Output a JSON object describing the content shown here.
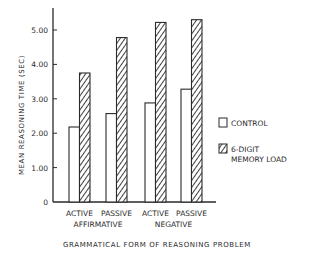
{
  "chart_data": {
    "type": "bar",
    "title": "",
    "xlabel": "GRAMMATICAL FORM OF REASONING PROBLEM",
    "ylabel": "MEAN REASONING TIME (SEC)",
    "ylim": [
      0,
      5.6
    ],
    "yticks": [
      0,
      1,
      2,
      3,
      4,
      5
    ],
    "ytick_labels": [
      "0",
      "1.00",
      "2.00",
      "3.00",
      "4.00",
      "5.00"
    ],
    "categories": [
      "ACTIVE",
      "PASSIVE",
      "ACTIVE",
      "PASSIVE"
    ],
    "category_groups": [
      {
        "label": "AFFIRMATIVE",
        "span": [
          0,
          1
        ]
      },
      {
        "label": "NEGATIVE",
        "span": [
          2,
          3
        ]
      }
    ],
    "series": [
      {
        "name": "CONTROL",
        "style": "open",
        "values": [
          2.18,
          2.57,
          2.88,
          3.28
        ]
      },
      {
        "name": "6-DIGIT MEMORY LOAD",
        "style": "hatched",
        "values": [
          3.75,
          4.78,
          5.22,
          5.3
        ]
      }
    ],
    "legend": {
      "position": "right",
      "entries": [
        {
          "lines": [
            "CONTROL"
          ]
        },
        {
          "lines": [
            "6-DIGIT",
            "MEMORY LOAD"
          ]
        }
      ]
    },
    "grid": false
  },
  "colors": {
    "ink": "#2a2a2a",
    "background": "#ffffff"
  }
}
